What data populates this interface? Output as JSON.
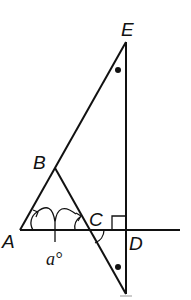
{
  "diagram": {
    "type": "geometry",
    "points": {
      "A": {
        "label": "A",
        "x": 20,
        "y": 230
      },
      "B": {
        "label": "B",
        "x": 55,
        "y": 168
      },
      "C": {
        "label": "C",
        "x": 88,
        "y": 230
      },
      "D": {
        "label": "D",
        "x": 126,
        "y": 230
      },
      "E": {
        "label": "E",
        "x": 126,
        "y": 42
      },
      "F": {
        "label": "",
        "x": 126,
        "y": 294
      }
    },
    "angle_label": "a°",
    "marks": {
      "right_angle_at": "D",
      "equal_angle_dots": [
        "E",
        "F"
      ],
      "congruent_angle_arcs": [
        "A",
        "C"
      ]
    },
    "line_color": "#111111"
  }
}
